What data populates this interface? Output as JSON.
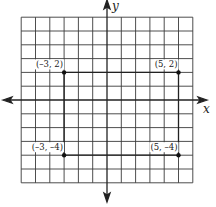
{
  "chart_data": {
    "type": "scatter",
    "title": "",
    "xlabel": "x",
    "ylabel": "y",
    "xlim": [
      -6,
      6
    ],
    "ylim": [
      -6,
      6
    ],
    "grid": true,
    "points": [
      {
        "x": -3,
        "y": 2,
        "label": "(–3, 2)"
      },
      {
        "x": 5,
        "y": 2,
        "label": "(5, 2)"
      },
      {
        "x": -3,
        "y": -4,
        "label": "(–3, –4)"
      },
      {
        "x": 5,
        "y": -4,
        "label": "(5, –4)"
      }
    ],
    "polyline": [
      [
        -3,
        -4
      ],
      [
        -3,
        2
      ],
      [
        5,
        2
      ],
      [
        5,
        -4
      ],
      [
        -3,
        -4
      ]
    ],
    "polyline_note": "Rectangle with vertices (-3,2), (5,2), (5,-4), (-3,-4)"
  },
  "axes": {
    "x_label": "x",
    "y_label": "y"
  },
  "colors": {
    "ink": "#222222",
    "grid": "#444444",
    "background": "#ffffff"
  }
}
